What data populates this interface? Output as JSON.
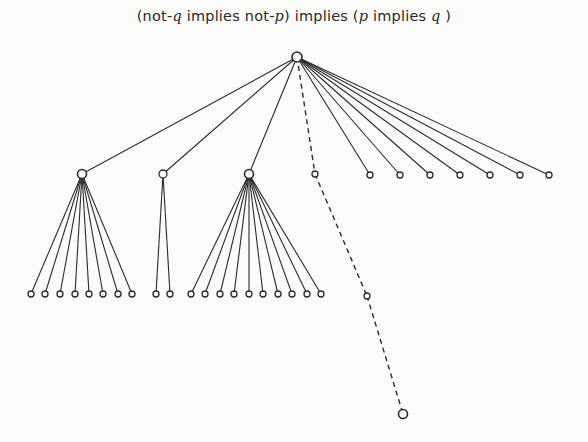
{
  "title": {
    "parts": [
      "(not-",
      "q",
      " implies not-",
      "p",
      ")  implies  (",
      "p",
      " implies ",
      "q",
      " )"
    ],
    "full": "(not-q implies not-p) implies (p implies q)"
  },
  "colors": {
    "line": "#2b2b2b",
    "background": "#fbfbfa"
  },
  "tree": {
    "root": {
      "x": 297,
      "y": 57,
      "r": 5
    },
    "children": [
      {
        "id": "A",
        "x": 82,
        "y": 174,
        "r": 4.5,
        "style": "solid",
        "leaves": [
          31,
          45,
          60,
          75,
          89,
          103,
          118,
          132
        ],
        "leaf_y": 294
      },
      {
        "id": "B",
        "x": 163,
        "y": 174,
        "r": 4,
        "style": "solid",
        "leaves": [
          156,
          170
        ],
        "leaf_y": 294
      },
      {
        "id": "C",
        "x": 249,
        "y": 174,
        "r": 4.5,
        "style": "solid",
        "leaves": [
          191,
          205,
          220,
          234,
          249,
          263,
          278,
          292,
          307,
          321
        ],
        "leaf_y": 294
      },
      {
        "id": "D",
        "x": 315,
        "y": 174,
        "r": 3,
        "style": "dashed",
        "chain": [
          {
            "x": 367,
            "y": 296,
            "r": 3
          },
          {
            "x": 403,
            "y": 414,
            "r": 4.5
          }
        ]
      }
    ],
    "direct_leaves": {
      "y": 175,
      "r": 3,
      "x": [
        370,
        400,
        430,
        460,
        490,
        520,
        549
      ]
    }
  }
}
